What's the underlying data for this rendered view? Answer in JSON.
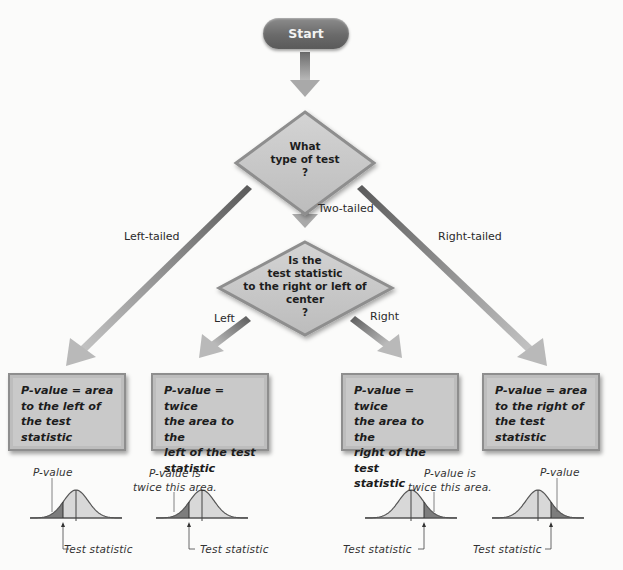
{
  "flowchart": {
    "start": {
      "label": "Start"
    },
    "decision_test_type": {
      "lines": [
        "What",
        "type of test",
        "?"
      ]
    },
    "decision_side": {
      "lines": [
        "Is the",
        "test statistic",
        "to the right or left of",
        "center",
        "?"
      ]
    },
    "branches": {
      "left_tailed": "Left-tailed",
      "two_tailed": "Two-tailed",
      "right_tailed": "Right-tailed",
      "left": "Left",
      "right": "Right"
    },
    "outcomes": [
      {
        "lines": [
          "P-value = area",
          "to the left of",
          "the test",
          "statistic"
        ]
      },
      {
        "lines": [
          "P-value = twice",
          "the area to the",
          "left of the test",
          "statistic"
        ]
      },
      {
        "lines": [
          "P-value = twice",
          "the area to the",
          "right of the test",
          "statistic"
        ]
      },
      {
        "lines": [
          "P-value = area",
          "to the right of",
          "the test",
          "statistic"
        ]
      }
    ]
  },
  "illustrations": [
    {
      "caption_lines": [
        "P-value"
      ],
      "tail": "left",
      "pointer_label": "Test statistic"
    },
    {
      "caption_lines": [
        "P-value is",
        "twice this area."
      ],
      "tail": "left",
      "pointer_label": "Test statistic"
    },
    {
      "caption_lines": [
        "P-value is",
        "twice this area."
      ],
      "tail": "right",
      "pointer_label": "Test statistic"
    },
    {
      "caption_lines": [
        "P-value"
      ],
      "tail": "right",
      "pointer_label": "Test statistic"
    }
  ],
  "colors": {
    "shape_fill": "#c9c9c9",
    "shape_border": "#8e8e8e",
    "start_fill": "#6f6f6f",
    "arrow": "#9a9a9a",
    "curve_light": "#d8d8d8",
    "curve_dark": "#7d7d7d"
  }
}
